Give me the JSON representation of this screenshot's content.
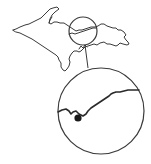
{
  "map": {
    "title": "Upper Peninsula locator map",
    "region": "Upper Peninsula of Michigan",
    "inset": {
      "description": "Magnified view of the highlighted area",
      "marker": "location-dot"
    },
    "colors": {
      "line": "#3a3a3a",
      "marker": "#1a1a1a",
      "background": "#ffffff"
    }
  }
}
